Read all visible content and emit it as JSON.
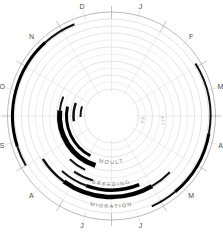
{
  "figure": {
    "type": "annual-cycle-ring-diagram",
    "center": {
      "x": 111.5,
      "y": 116
    },
    "background": "#ffffff",
    "arc_color": "#000000",
    "grid_color": "#c9c9c9"
  },
  "months": [
    {
      "label": "J",
      "name": "January",
      "angle_deg": 15
    },
    {
      "label": "F",
      "name": "February",
      "angle_deg": 45
    },
    {
      "label": "M",
      "name": "March",
      "angle_deg": 75
    },
    {
      "label": "A",
      "name": "April",
      "angle_deg": 105
    },
    {
      "label": "M",
      "name": "May",
      "angle_deg": 135
    },
    {
      "label": "J",
      "name": "June",
      "angle_deg": 165
    },
    {
      "label": "J",
      "name": "July",
      "angle_deg": 195
    },
    {
      "label": "A",
      "name": "August",
      "angle_deg": 225
    },
    {
      "label": "S",
      "name": "September",
      "angle_deg": 255
    },
    {
      "label": "O",
      "name": "October",
      "angle_deg": 285
    },
    {
      "label": "N",
      "name": "November",
      "angle_deg": 315
    },
    {
      "label": "D",
      "name": "December",
      "angle_deg": 345
    }
  ],
  "ring_labels": [
    {
      "id": "migration",
      "text": "MIGRATION",
      "radius": 92,
      "angle_deg": 180,
      "size": "normal"
    },
    {
      "id": "breeding",
      "text": "BREEDING",
      "radius": 70,
      "angle_deg": 180,
      "size": "normal"
    },
    {
      "id": "moult",
      "text": "MOULT",
      "radius": 48,
      "angle_deg": 180,
      "size": "normal"
    },
    {
      "id": "pb",
      "text": "PB",
      "radius": 33,
      "angle_deg": 96,
      "size": "small"
    },
    {
      "id": "firstyear",
      "text": "1YE",
      "radius": 53,
      "angle_deg": 94,
      "size": "small"
    }
  ],
  "rings": [
    {
      "id": "ring-outer-frame",
      "radius": 104,
      "kind": "outer"
    },
    {
      "id": "ring-migration-outer",
      "radius": 97,
      "kind": "grid"
    },
    {
      "id": "ring-migration-inner",
      "radius": 90,
      "kind": "grid"
    },
    {
      "id": "ring-1",
      "radius": 83,
      "kind": "grid"
    },
    {
      "id": "ring-2",
      "radius": 76,
      "kind": "grid-lt"
    },
    {
      "id": "ring-3",
      "radius": 69,
      "kind": "grid"
    },
    {
      "id": "ring-4",
      "radius": 62,
      "kind": "grid-lt"
    },
    {
      "id": "ring-5",
      "radius": 55,
      "kind": "grid"
    },
    {
      "id": "ring-6",
      "radius": 48,
      "kind": "grid-lt"
    },
    {
      "id": "ring-7",
      "radius": 41,
      "kind": "grid"
    },
    {
      "id": "ring-8",
      "radius": 34,
      "kind": "grid-lt"
    },
    {
      "id": "ring-9",
      "radius": 27,
      "kind": "grid"
    }
  ],
  "arcs": [
    {
      "id": "arc-a",
      "radius": 99,
      "width": 3.0,
      "start_deg": 252,
      "end_deg": 318
    },
    {
      "id": "arc-b",
      "radius": 99,
      "width": 2.0,
      "start_deg": 318,
      "end_deg": 338
    },
    {
      "id": "arc-c",
      "radius": 99,
      "width": 2.0,
      "start_deg": 240,
      "end_deg": 252
    },
    {
      "id": "arc-d",
      "radius": 99,
      "width": 3.0,
      "start_deg": 100,
      "end_deg": 140
    },
    {
      "id": "arc-e",
      "radius": 99,
      "width": 2.0,
      "start_deg": 58,
      "end_deg": 100
    },
    {
      "id": "arc-f",
      "radius": 99,
      "width": 2.0,
      "start_deg": 140,
      "end_deg": 156
    },
    {
      "id": "arc-g",
      "radius": 81,
      "width": 4.5,
      "start_deg": 150,
      "end_deg": 216
    },
    {
      "id": "arc-h",
      "radius": 81,
      "width": 2.5,
      "start_deg": 216,
      "end_deg": 238
    },
    {
      "id": "arc-i",
      "radius": 81,
      "width": 2.0,
      "start_deg": 134,
      "end_deg": 150
    },
    {
      "id": "arc-j",
      "radius": 74,
      "width": 3.5,
      "start_deg": 158,
      "end_deg": 200
    },
    {
      "id": "arc-k",
      "radius": 74,
      "width": 2.0,
      "start_deg": 200,
      "end_deg": 222
    },
    {
      "id": "arc-l",
      "radius": 67,
      "width": 2.0,
      "start_deg": 196,
      "end_deg": 214
    },
    {
      "id": "arc-m",
      "radius": 60,
      "width": 2.0,
      "start_deg": 206,
      "end_deg": 224
    },
    {
      "id": "arc-n",
      "radius": 52,
      "width": 5.0,
      "start_deg": 198,
      "end_deg": 276
    },
    {
      "id": "arc-o",
      "radius": 52,
      "width": 2.0,
      "start_deg": 276,
      "end_deg": 292
    },
    {
      "id": "arc-p",
      "radius": 45,
      "width": 3.0,
      "start_deg": 208,
      "end_deg": 282
    },
    {
      "id": "arc-q",
      "radius": 38,
      "width": 2.5,
      "start_deg": 262,
      "end_deg": 290
    },
    {
      "id": "arc-r",
      "radius": 31,
      "width": 2.0,
      "start_deg": 268,
      "end_deg": 288
    }
  ],
  "ticks": {
    "major_count": 12,
    "minor_count": 24
  }
}
